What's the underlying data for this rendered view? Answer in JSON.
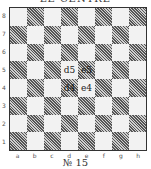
{
  "title": "LE CENTRE",
  "caption": "№ 15",
  "board": {
    "ranks": [
      "8",
      "7",
      "6",
      "5",
      "4",
      "3",
      "2",
      "1"
    ],
    "files": [
      "a",
      "b",
      "c",
      "d",
      "e",
      "f",
      "g",
      "h"
    ],
    "labels": {
      "d5": "d5",
      "e5": "e5",
      "d4": "d4",
      "e4": "e4"
    }
  },
  "colors": {
    "light": "#f2f2f2",
    "dark": "#9a9a9a",
    "border": "#333333"
  }
}
